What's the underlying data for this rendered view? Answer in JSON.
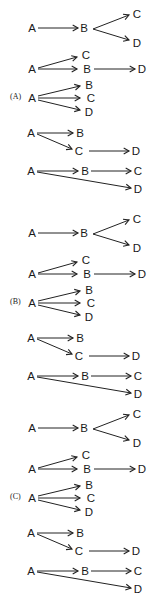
{
  "figure": {
    "sections": [
      {
        "id": "A",
        "label": "(A)",
        "offset_y": 0,
        "label_pos": [
          10,
          99
        ]
      },
      {
        "id": "B",
        "label": "(B)",
        "offset_y": 205,
        "label_pos": [
          10,
          99
        ]
      },
      {
        "id": "C",
        "label": "(C)",
        "offset_y": 400,
        "label_pos": [
          10,
          99
        ]
      }
    ],
    "diagrams": [
      {
        "name": "chain-then-split",
        "nodes": [
          {
            "id": "A",
            "text": "A",
            "x": 32,
            "y": 28
          },
          {
            "id": "B",
            "text": "B",
            "x": 84,
            "y": 28
          },
          {
            "id": "C",
            "text": "C",
            "x": 137,
            "y": 14
          },
          {
            "id": "D",
            "text": "D",
            "x": 137,
            "y": 43
          }
        ],
        "edges": [
          {
            "from": "A",
            "to": "B",
            "x1": 38,
            "y1": 28,
            "x2": 78,
            "y2": 28
          },
          {
            "from": "B",
            "to": "C",
            "x1": 93,
            "y1": 29,
            "x2": 129,
            "y2": 15
          },
          {
            "from": "B",
            "to": "D",
            "x1": 93,
            "y1": 29,
            "x2": 129,
            "y2": 40
          }
        ]
      },
      {
        "name": "split-then-chain",
        "nodes": [
          {
            "id": "A",
            "text": "A",
            "x": 32,
            "y": 69
          },
          {
            "id": "C",
            "text": "C",
            "x": 86,
            "y": 55
          },
          {
            "id": "B",
            "text": "B",
            "x": 87,
            "y": 69
          },
          {
            "id": "D",
            "text": "D",
            "x": 142,
            "y": 69
          }
        ],
        "edges": [
          {
            "from": "A",
            "to": "C",
            "x1": 38,
            "y1": 68,
            "x2": 77,
            "y2": 57
          },
          {
            "from": "A",
            "to": "B",
            "x1": 38,
            "y1": 69,
            "x2": 77,
            "y2": 69
          },
          {
            "from": "B",
            "to": "D",
            "x1": 94,
            "y1": 69,
            "x2": 135,
            "y2": 69
          }
        ]
      },
      {
        "name": "fan-out-three",
        "nodes": [
          {
            "id": "A",
            "text": "A",
            "x": 32,
            "y": 98
          },
          {
            "id": "B",
            "text": "B",
            "x": 89,
            "y": 85
          },
          {
            "id": "C",
            "text": "C",
            "x": 91,
            "y": 98
          },
          {
            "id": "D",
            "text": "D",
            "x": 89,
            "y": 112
          }
        ],
        "edges": [
          {
            "from": "A",
            "to": "B",
            "x1": 38,
            "y1": 96,
            "x2": 80,
            "y2": 86
          },
          {
            "from": "A",
            "to": "C",
            "x1": 38,
            "y1": 98,
            "x2": 80,
            "y2": 98
          },
          {
            "from": "A",
            "to": "D",
            "x1": 38,
            "y1": 100,
            "x2": 80,
            "y2": 110
          }
        ]
      },
      {
        "name": "split-with-branch-chain",
        "nodes": [
          {
            "id": "A",
            "text": "A",
            "x": 31,
            "y": 133
          },
          {
            "id": "B",
            "text": "B",
            "x": 80,
            "y": 133
          },
          {
            "id": "C",
            "text": "C",
            "x": 79,
            "y": 151
          },
          {
            "id": "D",
            "text": "D",
            "x": 136,
            "y": 151
          }
        ],
        "edges": [
          {
            "from": "A",
            "to": "B",
            "x1": 37,
            "y1": 133,
            "x2": 73,
            "y2": 133
          },
          {
            "from": "A",
            "to": "C",
            "x1": 37,
            "y1": 134,
            "x2": 72,
            "y2": 149
          },
          {
            "from": "C",
            "to": "D",
            "x1": 89,
            "y1": 151,
            "x2": 129,
            "y2": 151
          }
        ]
      },
      {
        "name": "chain-plus-direct",
        "nodes": [
          {
            "id": "A",
            "text": "A",
            "x": 31,
            "y": 171
          },
          {
            "id": "B",
            "text": "B",
            "x": 85,
            "y": 171
          },
          {
            "id": "C",
            "text": "C",
            "x": 138,
            "y": 171
          },
          {
            "id": "D",
            "text": "D",
            "x": 138,
            "y": 189
          }
        ],
        "edges": [
          {
            "from": "A",
            "to": "B",
            "x1": 37,
            "y1": 171,
            "x2": 78,
            "y2": 171
          },
          {
            "from": "B",
            "to": "C",
            "x1": 91,
            "y1": 171,
            "x2": 131,
            "y2": 171
          },
          {
            "from": "A",
            "to": "D",
            "x1": 37,
            "y1": 172,
            "x2": 131,
            "y2": 188
          }
        ]
      }
    ]
  },
  "colors": {
    "ink": "#222222",
    "background": "#ffffff"
  }
}
